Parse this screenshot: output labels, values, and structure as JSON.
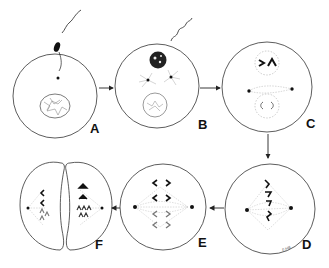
{
  "diagram": {
    "type": "cell-division-sequence",
    "stages": [
      {
        "id": "A",
        "label": "A",
        "description": "sperm entering egg, nucleus"
      },
      {
        "id": "B",
        "label": "B",
        "description": "asters forming, two pronuclei"
      },
      {
        "id": "C",
        "label": "C",
        "description": "spindle forming between pronuclei with chromosomes"
      },
      {
        "id": "D",
        "label": "D",
        "description": "metaphase, chromosomes on spindle"
      },
      {
        "id": "E",
        "label": "E",
        "description": "anaphase, chromosomes separating"
      },
      {
        "id": "F",
        "label": "F",
        "description": "telophase/cleavage into two cells"
      }
    ],
    "flow": [
      "A",
      "B",
      "C",
      "D",
      "E",
      "F"
    ],
    "signature": "F.Hill",
    "colors": {
      "stroke": "#222222",
      "background": "#ffffff",
      "fiber": "#9a9a9a"
    }
  }
}
